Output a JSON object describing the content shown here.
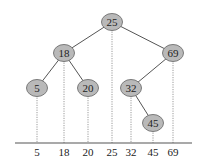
{
  "diagram": {
    "type": "binary-search-tree-projection",
    "colors": {
      "node_fill": "#b9b9b9",
      "node_stroke": "#7a7a7a",
      "edge": "#555555",
      "dotted": "#9a9a9a",
      "axis": "#555555",
      "text": "#222222"
    },
    "nodes": [
      {
        "id": "n25",
        "label": "25",
        "x": 112,
        "y": 22
      },
      {
        "id": "n18",
        "label": "18",
        "x": 64,
        "y": 53
      },
      {
        "id": "n69",
        "label": "69",
        "x": 173,
        "y": 53
      },
      {
        "id": "n5",
        "label": "5",
        "x": 37,
        "y": 88
      },
      {
        "id": "n20",
        "label": "20",
        "x": 88,
        "y": 88
      },
      {
        "id": "n32",
        "label": "32",
        "x": 131,
        "y": 88
      },
      {
        "id": "n45",
        "label": "45",
        "x": 153,
        "y": 123
      }
    ],
    "edges": [
      {
        "from": "n25",
        "to": "n18"
      },
      {
        "from": "n25",
        "to": "n69"
      },
      {
        "from": "n18",
        "to": "n5"
      },
      {
        "from": "n18",
        "to": "n20"
      },
      {
        "from": "n69",
        "to": "n32"
      },
      {
        "from": "n32",
        "to": "n45"
      }
    ],
    "axis": {
      "y": 143,
      "x_start": 15,
      "x_end": 192,
      "labels": [
        "5",
        "18",
        "20",
        "25",
        "32",
        "45",
        "69"
      ]
    }
  }
}
